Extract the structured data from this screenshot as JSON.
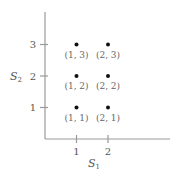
{
  "chart_data": {
    "type": "scatter",
    "title": "",
    "xlabel": "S",
    "xlabel_sub": "1",
    "ylabel": "S",
    "ylabel_sub": "2",
    "xlim": [
      0,
      3.5
    ],
    "ylim": [
      0,
      3.5
    ],
    "x_ticks": [
      1,
      2
    ],
    "y_ticks": [
      1,
      2,
      3
    ],
    "grid": false,
    "points": [
      {
        "x": 1,
        "y": 3,
        "label": "(1, 3)"
      },
      {
        "x": 2,
        "y": 3,
        "label": "(2, 3)"
      },
      {
        "x": 1,
        "y": 2,
        "label": "(1, 2)"
      },
      {
        "x": 2,
        "y": 2,
        "label": "(2, 2)"
      },
      {
        "x": 1,
        "y": 1,
        "label": "(1, 1)"
      },
      {
        "x": 2,
        "y": 1,
        "label": "(2, 1)"
      }
    ],
    "colors": {
      "axis": "#999999",
      "point": "#111111",
      "text": "#555555"
    }
  }
}
